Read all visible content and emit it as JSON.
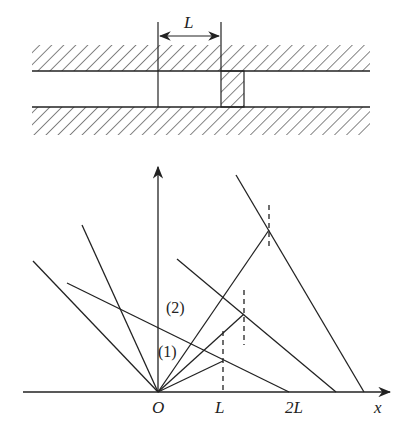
{
  "top_figure": {
    "description": "Tube with hatched walls, piston displaced by distance L",
    "length_label": "L",
    "walls": {
      "upper": {
        "y_top": 45,
        "y_line": 71
      },
      "lower": {
        "y_line": 107,
        "y_bottom": 135
      },
      "x_start": 32,
      "x_end": 370
    },
    "markers": {
      "left_x": 158,
      "right_x": 221,
      "top_y": 22
    },
    "piston": {
      "x": 221,
      "y": 71,
      "w": 23,
      "h": 36
    }
  },
  "bottom_figure": {
    "axes": {
      "x_label": "x",
      "origin_label": "O",
      "tick_labels": [
        "L",
        "2L"
      ]
    },
    "region_labels": [
      "(1)",
      "(2)"
    ],
    "origin": [
      158,
      392
    ],
    "rays_from_origin": [
      {
        "to": [
          33,
          261
        ]
      },
      {
        "to": [
          82,
          225
        ]
      },
      {
        "to": [
          223,
          361
        ]
      },
      {
        "to": [
          244,
          314
        ]
      },
      {
        "to": [
          269,
          230
        ]
      }
    ],
    "descending_lines": [
      {
        "from": [
          67,
          283
        ],
        "to": [
          289,
          392
        ]
      },
      {
        "from": [
          177,
          259
        ],
        "to": [
          336,
          392
        ]
      },
      {
        "from": [
          236,
          175
        ],
        "to": [
          364,
          392
        ]
      }
    ],
    "dashed_lines": [
      {
        "x": 223,
        "y1": 331,
        "y2": 392
      },
      {
        "x": 244,
        "y1": 290,
        "y2": 345
      },
      {
        "x": 269,
        "y1": 205,
        "y2": 250
      }
    ]
  }
}
